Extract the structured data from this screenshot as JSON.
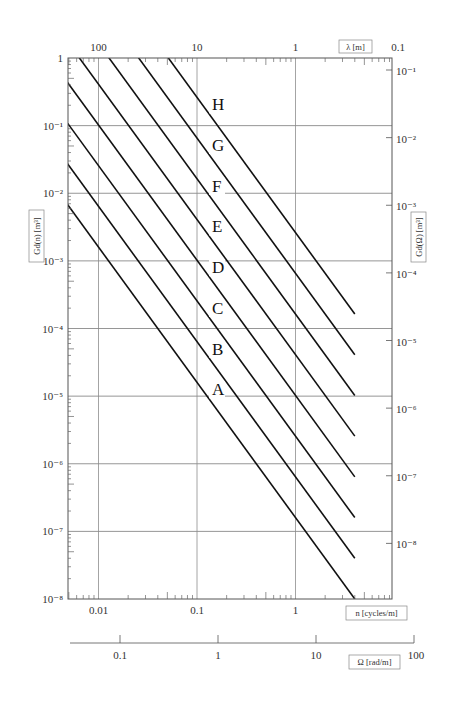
{
  "chart_data": {
    "type": "line",
    "title": "",
    "xlabel": "n [cycles/m]",
    "ylabel": "Gd(n) [m³]",
    "x_scale": "log",
    "y_scale": "log",
    "xlim": [
      0.005,
      3.0
    ],
    "ylim": [
      1e-08,
      1
    ],
    "grid": true,
    "x_ticks": [
      "0.01",
      "0.1",
      "1"
    ],
    "y_ticks": [
      "1",
      "10⁻¹",
      "10⁻²",
      "10⁻³",
      "10⁻⁴",
      "10⁻⁵",
      "10⁻⁶",
      "10⁻⁷",
      "10⁻⁸"
    ],
    "secondary_axes": {
      "top": {
        "label": "λ [m]",
        "ticks": [
          "100",
          "10",
          "1",
          "0.1"
        ]
      },
      "right": {
        "label": "Gd(Ω) [m³]",
        "ticks": [
          "10⁻¹",
          "10⁻²",
          "10⁻³",
          "10⁻⁴",
          "10⁻⁵",
          "10⁻⁶",
          "10⁻⁷",
          "10⁻⁸"
        ]
      },
      "bottom2": {
        "label": "Ω [rad/m]",
        "ticks": [
          "0.1",
          "1",
          "10",
          "100"
        ]
      }
    },
    "reference_n0": 0.1,
    "slope": -2,
    "series": [
      {
        "name": "A",
        "Gd_n0": 1.6e-05
      },
      {
        "name": "B",
        "Gd_n0": 6.4e-05
      },
      {
        "name": "C",
        "Gd_n0": 0.000256
      },
      {
        "name": "D",
        "Gd_n0": 0.001024
      },
      {
        "name": "E",
        "Gd_n0": 0.004096
      },
      {
        "name": "F",
        "Gd_n0": 0.016384
      },
      {
        "name": "G",
        "Gd_n0": 0.065536
      },
      {
        "name": "H",
        "Gd_n0": 0.262144
      }
    ],
    "legend": "inline labels A–H beside lines"
  },
  "labels": {
    "x_title": "n [cycles/m]",
    "top_title": "λ [m]",
    "left_title": "Gd(n) [m³]",
    "right_title": "Gd(Ω) [m³]",
    "bottom2_title": "Ω [rad/m]"
  }
}
